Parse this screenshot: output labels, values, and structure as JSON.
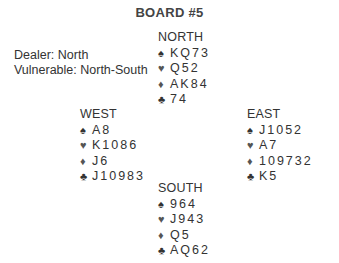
{
  "title": "BOARD #5",
  "info": {
    "dealer": "Dealer: North",
    "vulnerable": "Vulnerable: North-South"
  },
  "suits": {
    "spades": "♠",
    "hearts": "♥",
    "diamonds": "♦",
    "clubs": "♣"
  },
  "hands": {
    "north": {
      "seat": "NORTH",
      "spades": "KQ73",
      "hearts": "Q52",
      "diamonds": "AK84",
      "clubs": "74"
    },
    "west": {
      "seat": "WEST",
      "spades": "A8",
      "hearts": "K1086",
      "diamonds": "J6",
      "clubs": "J10983"
    },
    "east": {
      "seat": "EAST",
      "spades": "J1052",
      "hearts": "A7",
      "diamonds": "109732",
      "clubs": "K5"
    },
    "south": {
      "seat": "SOUTH",
      "spades": "964",
      "hearts": "J943",
      "diamonds": "Q5",
      "clubs": "AQ62"
    }
  }
}
